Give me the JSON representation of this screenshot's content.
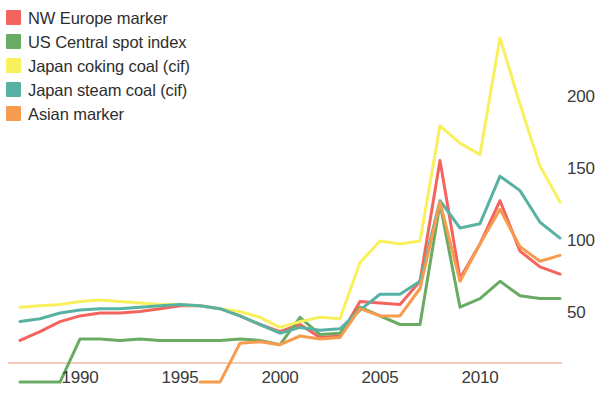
{
  "chart_data": {
    "type": "line",
    "title": "",
    "subtitle": "",
    "xlabel": "",
    "ylabel": "",
    "xlim": [
      1987,
      2014
    ],
    "ylim": [
      0,
      250
    ],
    "grid": false,
    "legend_position": "top-left",
    "x_ticks": [
      1990,
      1995,
      2000,
      2005,
      2010
    ],
    "x_tick_labels": [
      "1990",
      "1995",
      "2000",
      "2005",
      "2010"
    ],
    "y_ticks": [
      50,
      100,
      150,
      200
    ],
    "y_tick_labels": [
      "50",
      "100",
      "150",
      "200"
    ],
    "y_axis_side": "right",
    "x": [
      1987,
      1988,
      1989,
      1990,
      1991,
      1992,
      1993,
      1994,
      1995,
      1996,
      1997,
      1998,
      1999,
      2000,
      2001,
      2002,
      2003,
      2004,
      2005,
      2006,
      2007,
      2008,
      2009,
      2010,
      2011,
      2012,
      2013,
      2014
    ],
    "series": [
      {
        "name": "NW Europe marker",
        "color": "#f4645e",
        "values": [
          31,
          37,
          44,
          48,
          50,
          50,
          51,
          53,
          55,
          55,
          53,
          48,
          42,
          37,
          42,
          33,
          34,
          58,
          57,
          56,
          72,
          156,
          74,
          98,
          128,
          93,
          82,
          77
        ]
      },
      {
        "name": "US Central spot index",
        "color": "#6aab64",
        "values": [
          2,
          2,
          2,
          32,
          32,
          31,
          32,
          31,
          31,
          31,
          31,
          32,
          31,
          28,
          47,
          35,
          36,
          54,
          48,
          42,
          42,
          126,
          54,
          60,
          72,
          62,
          60,
          60
        ]
      },
      {
        "name": "Japan coking coal (cif)",
        "color": "#f9f05e",
        "values": [
          54,
          55,
          56,
          58,
          59,
          58,
          57,
          56,
          56,
          55,
          53,
          51,
          47,
          40,
          44,
          47,
          46,
          85,
          100,
          98,
          100,
          180,
          168,
          160,
          241,
          195,
          152,
          127
        ]
      },
      {
        "name": "Japan steam coal (cif)",
        "color": "#57b2a3",
        "values": [
          44,
          46,
          50,
          52,
          53,
          53,
          54,
          55,
          56,
          55,
          53,
          48,
          42,
          36,
          40,
          38,
          39,
          52,
          63,
          63,
          72,
          128,
          109,
          112,
          145,
          135,
          113,
          102
        ]
      },
      {
        "name": "Asian marker",
        "color": "#f79b4e",
        "values": [
          null,
          null,
          null,
          null,
          null,
          null,
          null,
          null,
          null,
          2,
          2,
          29,
          30,
          28,
          34,
          32,
          33,
          53,
          48,
          48,
          67,
          127,
          72,
          98,
          122,
          96,
          86,
          90
        ]
      }
    ],
    "annotations": []
  },
  "legend": {
    "items": [
      {
        "label": "NW Europe marker",
        "color": "#f4645e"
      },
      {
        "label": "US Central spot index",
        "color": "#6aab64"
      },
      {
        "label": "Japan coking coal (cif)",
        "color": "#f9f05e"
      },
      {
        "label": "Japan steam coal (cif)",
        "color": "#57b2a3"
      },
      {
        "label": "Asian marker",
        "color": "#f79b4e"
      }
    ]
  },
  "axis": {
    "x_labels": [
      "1990",
      "1995",
      "2000",
      "2005",
      "2010"
    ],
    "y_labels": [
      "200",
      "150",
      "100",
      "50"
    ]
  }
}
